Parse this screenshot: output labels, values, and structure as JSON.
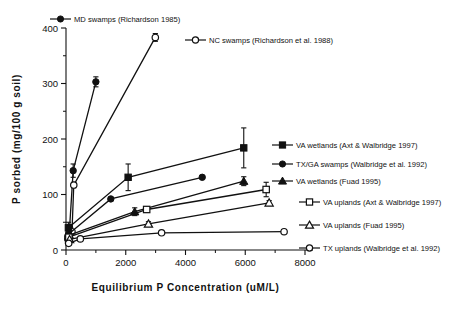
{
  "chart_data": {
    "type": "scatter",
    "title": "",
    "xlabel": "Equilibrium  P  Concentration   (uM/L)",
    "ylabel": "P sorbed  (mg/100  g  soil)",
    "xlim": [
      0,
      8000
    ],
    "ylim": [
      0,
      400
    ],
    "xticks": [
      0,
      2000,
      4000,
      6000,
      8000
    ],
    "xticklabels": [
      "0",
      "2000",
      "4000",
      "6000",
      "8000"
    ],
    "yticks": [
      0,
      100,
      200,
      300,
      400
    ],
    "yticklabels": [
      "0",
      "100",
      "200",
      "300",
      "400"
    ],
    "yminorticks": [
      50,
      150,
      250,
      350
    ],
    "xminorticks": [
      1000,
      3000,
      5000,
      7000
    ],
    "grid": false,
    "legend_position": "inside-right",
    "series": [
      {
        "name": "MD swamps (Richardson 1985)",
        "marker": "filled-circle",
        "points": [
          {
            "x": 60,
            "y": 25,
            "err": 0
          },
          {
            "x": 120,
            "y": 40,
            "err": 6
          },
          {
            "x": 240,
            "y": 143,
            "err": 12
          },
          {
            "x": 1000,
            "y": 303,
            "err": 9
          }
        ]
      },
      {
        "name": "NC swamps (Richardson et al. 1988)",
        "marker": "open-circle",
        "points": [
          {
            "x": 60,
            "y": 20,
            "err": 0
          },
          {
            "x": 200,
            "y": 33,
            "err": 0
          },
          {
            "x": 260,
            "y": 117,
            "err": 5
          },
          {
            "x": 2990,
            "y": 383,
            "err": 7
          }
        ]
      },
      {
        "name": "VA wetlands (Axt & Walbridge 1997)",
        "marker": "filled-square",
        "points": [
          {
            "x": 80,
            "y": 40,
            "err": 10
          },
          {
            "x": 2080,
            "y": 131,
            "err": 24
          },
          {
            "x": 5950,
            "y": 184,
            "err": 36
          }
        ]
      },
      {
        "name": "TX/GA swamps (Walbridge et al. 1992)",
        "marker": "filled-circle",
        "points": [
          {
            "x": 90,
            "y": 29,
            "err": 0
          },
          {
            "x": 1500,
            "y": 92,
            "err": 0
          },
          {
            "x": 4560,
            "y": 131,
            "err": 0
          }
        ]
      },
      {
        "name": "VA wetlands (Fuad 1995)",
        "marker": "filled-triangle",
        "points": [
          {
            "x": 110,
            "y": 27,
            "err": 0
          },
          {
            "x": 2300,
            "y": 69,
            "err": 7
          },
          {
            "x": 5950,
            "y": 124,
            "err": 8
          }
        ]
      },
      {
        "name": "VA uplands (Axt & Walbridge 1997)",
        "marker": "open-square",
        "points": [
          {
            "x": 95,
            "y": 23,
            "err": 0
          },
          {
            "x": 2700,
            "y": 73,
            "err": 5
          },
          {
            "x": 6700,
            "y": 109,
            "err": 13
          }
        ]
      },
      {
        "name": "VA uplands (Fuad 1995)",
        "marker": "open-triangle",
        "points": [
          {
            "x": 120,
            "y": 19,
            "err": 0
          },
          {
            "x": 2760,
            "y": 47,
            "err": 4
          },
          {
            "x": 6800,
            "y": 85,
            "err": 4
          }
        ]
      },
      {
        "name": "TX uplands (Walbridge et al. 1992)",
        "marker": "open-circle",
        "points": [
          {
            "x": 90,
            "y": 12,
            "err": 0
          },
          {
            "x": 480,
            "y": 20,
            "err": 0
          },
          {
            "x": 3200,
            "y": 31,
            "err": 0
          },
          {
            "x": 7300,
            "y": 33,
            "err": 0
          }
        ]
      }
    ],
    "legend_entries": [
      {
        "label": "MD swamps (Richardson 1985)",
        "marker": "filled-circle",
        "lx": 50,
        "ly": 19,
        "tx": 74
      },
      {
        "label": "NC swamps (Richardson et al. 1988)",
        "marker": "open-circle",
        "lx": 185,
        "ly": 40,
        "tx": 209
      },
      {
        "label": "VA wetlands (Axt & Walbridge 1997)",
        "marker": "filled-square",
        "lx": 272,
        "ly": 145,
        "tx": 296
      },
      {
        "label": "TX/GA swamps (Walbridge et al. 1992)",
        "marker": "filled-circle",
        "lx": 272,
        "ly": 164,
        "tx": 296
      },
      {
        "label": "VA wetlands (Fuad 1995)",
        "marker": "filled-triangle",
        "lx": 272,
        "ly": 181,
        "tx": 296
      },
      {
        "label": "VA uplands (Axt & Walbridge 1997)",
        "marker": "open-square",
        "lx": 299,
        "ly": 202,
        "tx": 323
      },
      {
        "label": "VA uplands (Fuad 1995)",
        "marker": "open-triangle",
        "lx": 299,
        "ly": 225,
        "tx": 323
      },
      {
        "label": "TX uplands (Walbridge et al. 1992)",
        "marker": "open-circle",
        "lx": 299,
        "ly": 248,
        "tx": 323
      }
    ]
  }
}
